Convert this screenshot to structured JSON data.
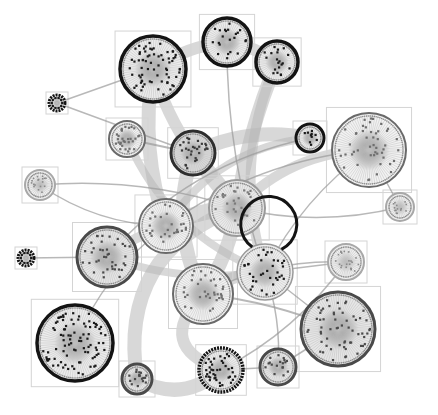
{
  "diagram": {
    "type": "clustered-network-graph",
    "width": 438,
    "height": 415,
    "background": "#ffffff",
    "colors": {
      "box_stroke": "#d4d4d4",
      "edge_thick": "#b8b8b8",
      "edge_thin": "#9a9a9a",
      "ring_dark": "#141414",
      "ring_gray": "#6a6a6a",
      "ring_light": "#a8a8a8",
      "node_dark": "#1a1a1a",
      "node_gray": "#6e6e6e",
      "spoke": "#bdbdbd",
      "fill_gray": "#c9c9c9"
    },
    "clusters": [
      {
        "id": "A",
        "cx": 153,
        "cy": 69,
        "r": 33,
        "style": "dark",
        "nodes": 70
      },
      {
        "id": "B",
        "cx": 227,
        "cy": 42,
        "r": 24,
        "style": "dark",
        "nodes": 22
      },
      {
        "id": "C",
        "cx": 277,
        "cy": 62,
        "r": 21,
        "style": "dark",
        "nodes": 20
      },
      {
        "id": "D",
        "cx": 57,
        "cy": 103,
        "r": 8,
        "style": "tiny",
        "nodes": 10
      },
      {
        "id": "E",
        "cx": 127,
        "cy": 139,
        "r": 18,
        "style": "gray",
        "nodes": 30
      },
      {
        "id": "F",
        "cx": 193,
        "cy": 153,
        "r": 22,
        "style": "darkgray",
        "nodes": 30
      },
      {
        "id": "G",
        "cx": 310,
        "cy": 138,
        "r": 14,
        "style": "dark",
        "nodes": 10
      },
      {
        "id": "H",
        "cx": 369,
        "cy": 150,
        "r": 37,
        "style": "gray",
        "nodes": 48
      },
      {
        "id": "I",
        "cx": 40,
        "cy": 185,
        "r": 15,
        "style": "light",
        "nodes": 18
      },
      {
        "id": "J",
        "cx": 400,
        "cy": 207,
        "r": 14,
        "style": "light",
        "nodes": 14
      },
      {
        "id": "K",
        "cx": 237,
        "cy": 208,
        "r": 28,
        "style": "lightgray",
        "nodes": 30
      },
      {
        "id": "L",
        "cx": 166,
        "cy": 226,
        "r": 27,
        "style": "gray",
        "nodes": 30
      },
      {
        "id": "M",
        "cx": 107,
        "cy": 257,
        "r": 30,
        "style": "grayring",
        "nodes": 40
      },
      {
        "id": "N",
        "cx": 26,
        "cy": 258,
        "r": 8,
        "style": "tiny",
        "nodes": 10
      },
      {
        "id": "O",
        "cx": 265,
        "cy": 272,
        "r": 28,
        "style": "darkhalf",
        "nodes": 36
      },
      {
        "id": "P",
        "cx": 346,
        "cy": 262,
        "r": 18,
        "style": "light",
        "nodes": 22
      },
      {
        "id": "Q",
        "cx": 203,
        "cy": 294,
        "r": 30,
        "style": "gray",
        "nodes": 36
      },
      {
        "id": "R",
        "cx": 75,
        "cy": 343,
        "r": 38,
        "style": "dark",
        "nodes": 90
      },
      {
        "id": "S",
        "cx": 137,
        "cy": 379,
        "r": 15,
        "style": "grayring",
        "nodes": 18
      },
      {
        "id": "T",
        "cx": 221,
        "cy": 370,
        "r": 22,
        "style": "darkdense",
        "nodes": 40
      },
      {
        "id": "U",
        "cx": 278,
        "cy": 367,
        "r": 18,
        "style": "grayring",
        "nodes": 18
      },
      {
        "id": "V",
        "cx": 338,
        "cy": 329,
        "r": 37,
        "style": "grayring",
        "nodes": 60
      }
    ],
    "edges": [
      {
        "from": "A",
        "to": "B",
        "w": 12,
        "bend": -10
      },
      {
        "from": "B",
        "to": "C",
        "w": 12,
        "bend": -6
      },
      {
        "from": "A",
        "to": "L",
        "w": 14,
        "bend": 20
      },
      {
        "from": "A",
        "to": "F",
        "w": 12,
        "bend": 8
      },
      {
        "from": "C",
        "to": "K",
        "w": 14,
        "bend": 10
      },
      {
        "from": "C",
        "to": "O",
        "w": 10,
        "bend": 40
      },
      {
        "from": "F",
        "to": "K",
        "w": 16,
        "bend": 0
      },
      {
        "from": "F",
        "to": "G",
        "w": 14,
        "bend": -20
      },
      {
        "from": "F",
        "to": "Q",
        "w": 14,
        "bend": 30
      },
      {
        "from": "K",
        "to": "L",
        "w": 16,
        "bend": 8
      },
      {
        "from": "K",
        "to": "Q",
        "w": 14,
        "bend": -10
      },
      {
        "from": "L",
        "to": "M",
        "w": 10,
        "bend": 6
      },
      {
        "from": "Q",
        "to": "T",
        "w": 12,
        "bend": 60
      },
      {
        "from": "S",
        "to": "T",
        "w": 14,
        "bend": 30
      },
      {
        "from": "S",
        "to": "K",
        "w": 14,
        "bend": -80
      },
      {
        "from": "O",
        "to": "Q",
        "w": 12,
        "bend": 10
      },
      {
        "from": "K",
        "to": "H",
        "w": 10,
        "bend": -30
      },
      {
        "from": "M",
        "to": "O",
        "w": 8,
        "bend": 20
      },
      {
        "from": "L",
        "to": "G",
        "w": 8,
        "bend": -40
      },
      {
        "from": "E",
        "to": "O",
        "w": 8,
        "bend": 40
      },
      {
        "from": "D",
        "to": "F",
        "w": 1.5,
        "bend": 0
      },
      {
        "from": "I",
        "to": "K",
        "w": 1.5,
        "bend": -20
      },
      {
        "from": "I",
        "to": "L",
        "w": 1.5,
        "bend": 20
      },
      {
        "from": "N",
        "to": "M",
        "w": 1.5,
        "bend": 0
      },
      {
        "from": "J",
        "to": "H",
        "w": 1.5,
        "bend": 0
      },
      {
        "from": "J",
        "to": "K",
        "w": 1.5,
        "bend": -20
      },
      {
        "from": "H",
        "to": "O",
        "w": 1.5,
        "bend": 20
      },
      {
        "from": "P",
        "to": "O",
        "w": 1.5,
        "bend": 0
      },
      {
        "from": "P",
        "to": "Q",
        "w": 1.5,
        "bend": 20
      },
      {
        "from": "V",
        "to": "U",
        "w": 1.5,
        "bend": 0
      },
      {
        "from": "V",
        "to": "O",
        "w": 1.5,
        "bend": 0
      },
      {
        "from": "U",
        "to": "O",
        "w": 1.5,
        "bend": 10
      },
      {
        "from": "U",
        "to": "T",
        "w": 1.5,
        "bend": 0
      },
      {
        "from": "R",
        "to": "L",
        "w": 1.5,
        "bend": -20
      },
      {
        "from": "E",
        "to": "F",
        "w": 2,
        "bend": 0
      },
      {
        "from": "B",
        "to": "O",
        "w": 1.5,
        "bend": 20
      },
      {
        "from": "A",
        "to": "D",
        "w": 1.5,
        "bend": 0
      },
      {
        "from": "G",
        "to": "M",
        "w": 1.5,
        "bend": 40
      },
      {
        "from": "H",
        "to": "L",
        "w": 1.5,
        "bend": 30
      },
      {
        "from": "Q",
        "to": "V",
        "w": 2,
        "bend": -10
      },
      {
        "from": "T",
        "to": "P",
        "w": 1.5,
        "bend": 20
      }
    ]
  }
}
